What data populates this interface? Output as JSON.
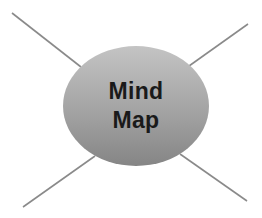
{
  "diagram": {
    "type": "mind-map",
    "central_node": {
      "label_line1": "Mind",
      "label_line2": "Map",
      "shape": "ellipse",
      "fill_top": "#c4c4c4",
      "fill_bottom": "#858585",
      "text_color": "#1a1a1a"
    },
    "branches": [
      {
        "name": "top-left",
        "x1": 81,
        "y1": 67,
        "x2": 12,
        "y2": 13
      },
      {
        "name": "top-right",
        "x1": 189,
        "y1": 66,
        "x2": 248,
        "y2": 24
      },
      {
        "name": "bottom-left",
        "x1": 95,
        "y1": 156,
        "x2": 23,
        "y2": 207
      },
      {
        "name": "bottom-right",
        "x1": 180,
        "y1": 154,
        "x2": 247,
        "y2": 201
      }
    ],
    "branch_color": "#8a8a8a"
  }
}
